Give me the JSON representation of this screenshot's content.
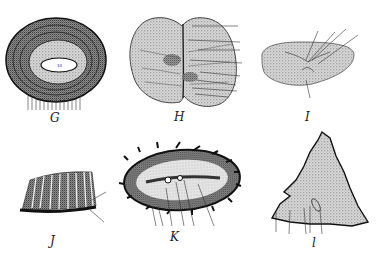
{
  "colors": {
    "ink": "#222222",
    "stipple": "#8a8a8a",
    "light_stipple": "#c4c4c4",
    "background": "#ffffff"
  },
  "figures": [
    {
      "id": "G",
      "label": "G",
      "description": "concentric layered oval section with central lumen",
      "center_label": "10",
      "callouts": [
        "1",
        "2",
        "3",
        "4",
        "5",
        "6",
        "7",
        "8",
        "9",
        "10",
        "11",
        "12",
        "13",
        "14"
      ]
    },
    {
      "id": "H",
      "label": "H",
      "description": "bilobed section with median division",
      "callouts": [
        "1",
        "2",
        "3",
        "4",
        "5",
        "6",
        "7",
        "8"
      ]
    },
    {
      "id": "I",
      "label": "I",
      "description": "kidney-shaped section with central branching structure",
      "callouts": [
        "1",
        "2",
        "3",
        "4",
        "5"
      ]
    },
    {
      "id": "J",
      "label": "J",
      "description": "curved ribbed strip with dark basal layer",
      "callouts": [
        "1",
        "2"
      ]
    },
    {
      "id": "K",
      "label": "K",
      "description": "elongated oval section with spiny border and central slit",
      "callouts": [
        "1",
        "2",
        "3",
        "4",
        "5",
        "6"
      ]
    },
    {
      "id": "L",
      "label": "l",
      "description": "triangular section with jagged border",
      "callouts": [
        "1",
        "2",
        "3",
        "4",
        "5"
      ]
    }
  ]
}
